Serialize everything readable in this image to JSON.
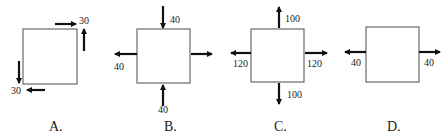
{
  "panels": [
    {
      "id": "A",
      "caption": "A.",
      "forces": [
        {
          "position": "top-right",
          "direction": "right",
          "value": "30"
        },
        {
          "position": "right",
          "direction": "up",
          "value": ""
        },
        {
          "position": "left",
          "direction": "down",
          "value": ""
        },
        {
          "position": "bottom-left",
          "direction": "left",
          "value": "30"
        }
      ],
      "labels": {
        "top": "30",
        "bottom": "30"
      }
    },
    {
      "id": "B",
      "caption": "B.",
      "forces": [
        {
          "position": "top",
          "direction": "down",
          "value": "40"
        },
        {
          "position": "left",
          "direction": "left",
          "value": "40"
        },
        {
          "position": "right",
          "direction": "right",
          "value": ""
        },
        {
          "position": "bottom",
          "direction": "up",
          "value": "40"
        }
      ],
      "labels": {
        "top": "40",
        "left": "40",
        "bottom": "40"
      }
    },
    {
      "id": "C",
      "caption": "C.",
      "forces": [
        {
          "position": "top",
          "direction": "up",
          "value": "100"
        },
        {
          "position": "left",
          "direction": "left",
          "value": "120"
        },
        {
          "position": "right",
          "direction": "right",
          "value": "120"
        },
        {
          "position": "bottom",
          "direction": "down",
          "value": "100"
        }
      ],
      "labels": {
        "top": "100",
        "left": "120",
        "right": "120",
        "bottom": "100"
      }
    },
    {
      "id": "D",
      "caption": "D.",
      "forces": [
        {
          "position": "left",
          "direction": "left",
          "value": "40"
        },
        {
          "position": "right",
          "direction": "right",
          "value": "40"
        }
      ],
      "labels": {
        "left": "40",
        "right": "40"
      }
    }
  ]
}
